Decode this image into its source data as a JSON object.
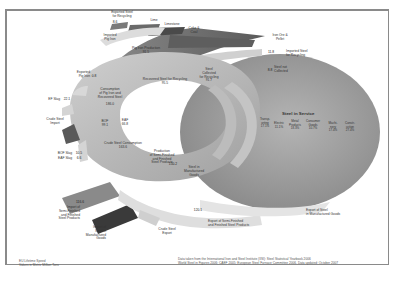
{
  "diagram": {
    "title_stock": "Steel in Service",
    "flows": {
      "exported_steel_recycling": {
        "label": "Exported Steel\nfor Recycling",
        "value": "8.6"
      },
      "imported_pig_iron": {
        "label": "Imported\nPig Iron",
        "value": ""
      },
      "lime": {
        "label": "Lime",
        "value": ""
      },
      "limestone": {
        "label": "Limestone",
        "value": ""
      },
      "coke_coal": {
        "label": "Coke &\nCoal",
        "value": ""
      },
      "iron_ore_pellet": {
        "label": "Iron Ore &\nPellet",
        "value": ""
      },
      "pig_iron_production": {
        "label": "Pig Iron Production",
        "value": "91.5"
      },
      "imported_steel_recycling": {
        "label": "Imported Steel\nfor Recycling",
        "value": "11.8"
      },
      "steel_not_collected": {
        "label": "Steel not\nCollected",
        "value": "8.8"
      },
      "exported_pig_iron": {
        "label": "Exported\nPig Iron",
        "value": "0.8"
      },
      "recovered_steel_recycling": {
        "label": "Recovered Steel for Recycling",
        "value": "95.5"
      },
      "steel_collected_recycling": {
        "label": "Steel\nCollected\nfor Recycling",
        "value": "91.7"
      },
      "consumption_pig_iron_recovered": {
        "label": "Consumption\nof Pig Iron and\nRecovered Steel",
        "value": "186.0"
      },
      "eaf_slag": {
        "label": "EF Slag",
        "value": "22.1"
      },
      "crude_steel_import": {
        "label": "Crude Steel\nImport",
        "value": ""
      },
      "bof": {
        "label": "BOF",
        "value": "99.1"
      },
      "eaf": {
        "label": "EAF",
        "value": "66.8"
      },
      "bof_slag": {
        "label": "BOF Slag",
        "value": "10.5"
      },
      "eaf_slag2": {
        "label": "EAF Slag",
        "value": "6.6"
      },
      "crude_steel_consumption": {
        "label": "Crude Steel Consumption",
        "value": "163.6"
      },
      "production_semifinished": {
        "label": "Production\nof Semi-Finished\nand Finished\nSteel Products",
        "value": "150.2"
      },
      "steel_manufactured_goods": {
        "label": "Steel in\nManufactured\nGoods",
        "value": ""
      },
      "import_semifinished": {
        "label": "Import of\nSemi-Finished\nand Finished\nSteel Products",
        "value": "116.6"
      },
      "import_manufactured_goods": {
        "label": "Import of\nSteel in\nManufactured\nGoods",
        "value": ""
      },
      "crude_steel_export": {
        "label": "Crude Steel\nExport",
        "value": ""
      },
      "export_semifinished": {
        "label": "Export of Semi-Finished\nand Finished Steel Products",
        "value": "120.1"
      },
      "export_manufactured_goods": {
        "label": "Export of Steel\nin Manufactured Goods",
        "value": ""
      }
    },
    "stock_cells": [
      {
        "label": "Transp-\norting",
        "value": "17.1%"
      },
      {
        "label": "Electric",
        "value": "11.1%"
      },
      {
        "label": "Metal\nProducts",
        "value": "18.3%"
      },
      {
        "label": "Consumer\nGoods",
        "value": "10.7%"
      },
      {
        "label": "Machi-\nnery",
        "value": "17.4%"
      },
      {
        "label": "Constr-\nuction",
        "value": "27.4%"
      }
    ],
    "footer_left": [
      "EU Lifetime Speed",
      "Values in Metric Million Tons"
    ],
    "footer_right": [
      "Data taken from the International Iron and Steel Institute (IISI): Steel Statistical Yearbook 2006",
      "World Steel in Figures 2006; CAEF 2005; European Steel Furnace Committee 2006. Data updated: October 2007"
    ],
    "colors": {
      "frame": "#8a8a8a",
      "light_band": "#d8d8d8",
      "mid_band": "#a9a9a9",
      "dark_band": "#6e6e6e",
      "darkest_band": "#3c3c3c",
      "stock_disk": "#9c9c9c"
    }
  }
}
